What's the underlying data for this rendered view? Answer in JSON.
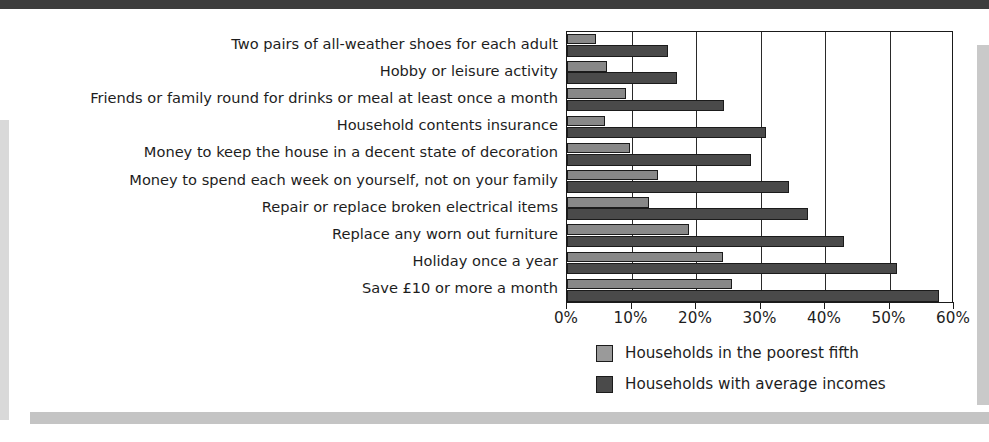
{
  "chart_data": {
    "type": "bar",
    "orientation": "horizontal",
    "grouped": true,
    "title": "",
    "subtitle": "",
    "xlabel": "",
    "ylabel": "",
    "xlim": [
      0,
      60
    ],
    "xtick_values": [
      0,
      10,
      20,
      30,
      40,
      50,
      60
    ],
    "xtick_labels": [
      "0%",
      "10%",
      "20%",
      "30%",
      "40%",
      "50%",
      "60%"
    ],
    "grid": true,
    "grid_axis": "x",
    "legend_position": "bottom-right",
    "categories": [
      "Two pairs of all-weather shoes for each adult",
      "Hobby or leisure activity",
      "Friends or family round for drinks or meal at least once a month",
      "Household contents insurance",
      "Money to keep the house in a decent state of decoration",
      "Money to spend each week on yourself, not on your family",
      "Repair or replace broken electrical items",
      "Replace any worn out furniture",
      "Holiday once a year",
      "Save £10 or more a month"
    ],
    "series": [
      {
        "name": "Households in the poorest fifth",
        "color": "#888888",
        "values": [
          4.5,
          6.2,
          9.1,
          5.9,
          9.8,
          14.1,
          12.7,
          18.9,
          24.2,
          25.6
        ]
      },
      {
        "name": "Households with average incomes",
        "color": "#4a4a4a",
        "values": [
          15.7,
          17.1,
          24.3,
          30.8,
          28.5,
          34.4,
          37.4,
          43.0,
          51.2,
          57.7
        ]
      }
    ]
  },
  "legend": {
    "items": [
      {
        "label": "Households in the poorest fifth",
        "swatch": "light"
      },
      {
        "label": "Households with average incomes",
        "swatch": "dark"
      }
    ]
  },
  "colors": {
    "series_light": "#888888",
    "series_dark": "#4a4a4a",
    "axis": "#1a1a1a",
    "text": "#1d1d1d",
    "card_background": "#ffffff",
    "top_band": "#3d3d3d",
    "shadow": "#c4c4c4"
  }
}
